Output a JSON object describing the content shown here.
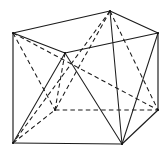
{
  "figure": {
    "kind": "line-drawing",
    "caption": "",
    "canvas": {
      "width": 168,
      "height": 156,
      "background": "#ffffff"
    },
    "stroke_color": "#1a1a1a",
    "hidden_stroke_style": "dashed",
    "visible_stroke_style": "solid",
    "vertices": {
      "top_front_left": {
        "label": "A",
        "x": 13,
        "y": 33
      },
      "top_front_right": {
        "label": "B",
        "x": 65,
        "y": 53
      },
      "top_back_right": {
        "label": "C",
        "x": 158,
        "y": 33
      },
      "top_back_left": {
        "label": "D",
        "x": 110,
        "y": 11
      },
      "bot_front_left": {
        "label": "E",
        "x": 13,
        "y": 143
      },
      "bot_front_right": {
        "label": "F",
        "x": 122,
        "y": 144
      },
      "bot_back_right": {
        "label": "G",
        "x": 158,
        "y": 110
      },
      "bot_back_left": {
        "label": "H",
        "x": 55,
        "y": 110
      }
    },
    "edges_solid": [
      {
        "name": "top-left-to-top-front",
        "from": "top_front_left",
        "to": "top_front_right"
      },
      {
        "name": "top-front-to-top-right",
        "from": "top_front_right",
        "to": "top_back_right"
      },
      {
        "name": "top-right-to-top-back",
        "from": "top_back_right",
        "to": "top_back_left"
      },
      {
        "name": "top-back-to-top-left",
        "from": "top_back_left",
        "to": "top_front_left"
      },
      {
        "name": "left-vertical",
        "from": "top_front_left",
        "to": "bot_front_left"
      },
      {
        "name": "right-vertical",
        "from": "top_back_right",
        "to": "bot_back_right"
      },
      {
        "name": "bottom-front",
        "from": "bot_front_left",
        "to": "bot_front_right"
      },
      {
        "name": "bottom-right-slant",
        "from": "bot_front_right",
        "to": "bot_back_right"
      }
    ],
    "edges_dashed": [
      {
        "name": "hidden-bottom-back-left",
        "from": "bot_front_left",
        "to": "bot_back_left"
      },
      {
        "name": "hidden-bottom-back-right",
        "from": "bot_back_left",
        "to": "bot_back_right"
      },
      {
        "name": "hidden-vertical-back-left",
        "from": "top_front_right",
        "to": "bot_back_left"
      }
    ],
    "diagonals_solid": [
      {
        "name": "diag-topfront-to-botfrontleft",
        "from": "top_front_right",
        "to": "bot_front_left"
      },
      {
        "name": "diag-topfront-to-botfrontright",
        "from": "top_front_right",
        "to": "bot_front_right"
      },
      {
        "name": "diag-topright-to-botfrontright",
        "from": "top_back_right",
        "to": "bot_front_right"
      },
      {
        "name": "diag-botfrontright-to-topback",
        "from": "bot_front_right",
        "to": "top_back_left"
      }
    ],
    "diagonals_dashed": [
      {
        "name": "hdiag-topleft-to-botbackleft",
        "from": "top_front_left",
        "to": "bot_back_left"
      },
      {
        "name": "hdiag-topleft-to-botbackright",
        "from": "top_front_left",
        "to": "bot_back_right"
      },
      {
        "name": "hdiag-topback-to-botbackleft",
        "from": "top_back_left",
        "to": "bot_back_left"
      },
      {
        "name": "hdiag-topback-to-botbackright",
        "from": "top_back_left",
        "to": "bot_back_right"
      },
      {
        "name": "hdiag-topback-to-botfrontleft",
        "from": "top_back_left",
        "to": "bot_front_left"
      }
    ]
  }
}
